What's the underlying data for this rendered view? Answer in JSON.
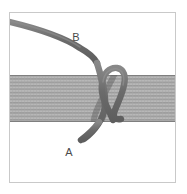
{
  "figure": {
    "background_color": "#ffffff",
    "border": {
      "name": "figure-border",
      "color": "#c9c9c9",
      "x": 9,
      "y": 12,
      "width": 167,
      "height": 171
    },
    "band": {
      "name": "woven-band",
      "fill_color": "#b3b3b3",
      "stripe_color": "#8f8f8f",
      "edge_color": "#7d7d7d",
      "top": 75,
      "bottom": 122,
      "stripe_count": 14
    },
    "cord": {
      "name": "cord",
      "color": "#6e6e6e",
      "highlight_color": "#8a8a8a",
      "thickness": 6
    },
    "labels": [
      {
        "id": "label-b",
        "text": "B",
        "x": 76,
        "y": 41
      },
      {
        "id": "label-a",
        "text": "A",
        "x": 69,
        "y": 156
      }
    ]
  }
}
